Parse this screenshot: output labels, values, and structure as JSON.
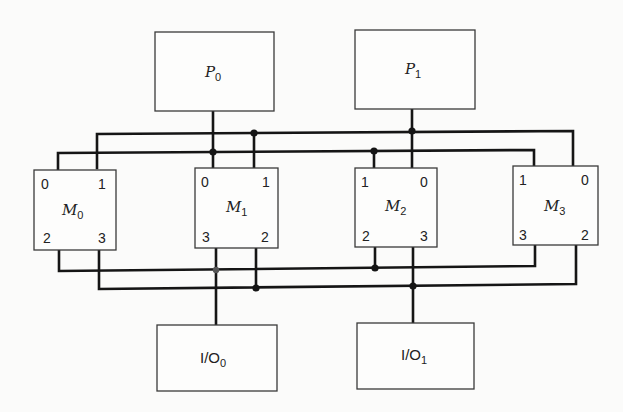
{
  "diagram": {
    "title": "",
    "processors": [
      {
        "id": "P0",
        "base": "P",
        "sub": "0"
      },
      {
        "id": "P1",
        "base": "P",
        "sub": "1"
      }
    ],
    "memories": [
      {
        "id": "M0",
        "base": "M",
        "sub": "0",
        "ports": {
          "top_left": "0",
          "top_right": "1",
          "bottom_left": "2",
          "bottom_right": "3"
        }
      },
      {
        "id": "M1",
        "base": "M",
        "sub": "1",
        "ports": {
          "top_left": "0",
          "top_right": "1",
          "bottom_left": "3",
          "bottom_right": "2"
        }
      },
      {
        "id": "M2",
        "base": "M",
        "sub": "2",
        "ports": {
          "top_left": "1",
          "top_right": "0",
          "bottom_left": "2",
          "bottom_right": "3"
        }
      },
      {
        "id": "M3",
        "base": "M",
        "sub": "3",
        "ports": {
          "top_left": "1",
          "top_right": "0",
          "bottom_left": "3",
          "bottom_right": "2"
        }
      }
    ],
    "io": [
      {
        "id": "IO0",
        "base": "I/O",
        "sub": "0"
      },
      {
        "id": "IO1",
        "base": "I/O",
        "sub": "1"
      }
    ],
    "buses": [
      {
        "name": "upper-bus-a",
        "connects": [
          "M0.1",
          "M1.1",
          "P1",
          "M3.0"
        ]
      },
      {
        "name": "upper-bus-b",
        "connects": [
          "M0.0",
          "P0",
          "M2.1",
          "M3.1"
        ]
      },
      {
        "name": "lower-bus-a",
        "connects": [
          "M0.2",
          "IO0",
          "M2.2",
          "M3.3"
        ]
      },
      {
        "name": "lower-bus-b",
        "connects": [
          "M0.3",
          "M1.2",
          "IO1",
          "M3.2"
        ]
      }
    ]
  }
}
